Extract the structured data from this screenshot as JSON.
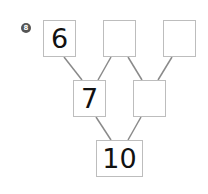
{
  "problem_number": "8",
  "tree": {
    "top": [
      {
        "id": "top-left",
        "value": "6"
      },
      {
        "id": "top-middle",
        "value": ""
      },
      {
        "id": "top-right",
        "value": ""
      }
    ],
    "middle": [
      {
        "id": "middle-left",
        "value": "7"
      },
      {
        "id": "middle-right",
        "value": ""
      }
    ],
    "bottom": {
      "id": "bottom",
      "value": "10"
    }
  },
  "colors": {
    "line": "#8a8a8a",
    "box_border": "#bdbdbd",
    "badge": "#555555"
  }
}
